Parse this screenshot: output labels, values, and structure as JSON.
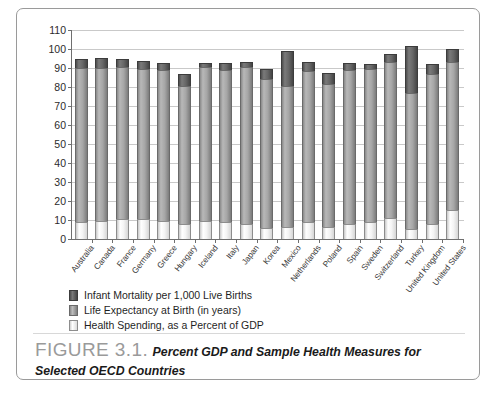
{
  "figure": {
    "label": "FIGURE 3.1.",
    "caption": "Percent GDP and Sample Health Measures for Selected OECD Countries"
  },
  "legend": {
    "position": "below-plot",
    "items": [
      {
        "label": "Infant Mortality per 1,000 Live Births",
        "color": "#5a5a5a",
        "key": "infant"
      },
      {
        "label": "Life Expectancy at Birth (in years)",
        "color": "#a6a6a6",
        "key": "life"
      },
      {
        "label": "Health Spending, as a Percent of GDP",
        "color": "#efefef",
        "key": "spend"
      }
    ]
  },
  "chart_data": {
    "type": "bar",
    "stacked": true,
    "title": "",
    "xlabel": "",
    "ylabel": "",
    "ylim": [
      0,
      110
    ],
    "yticks": [
      0,
      10,
      20,
      30,
      40,
      50,
      60,
      70,
      80,
      90,
      100,
      110
    ],
    "grid": true,
    "legend_position": "below-plot",
    "categories": [
      "Australia",
      "Canada",
      "France",
      "Germany",
      "Greece",
      "Hungary",
      "Iceland",
      "Italy",
      "Japan",
      "Korea",
      "Mexico",
      "Netherlands",
      "Poland",
      "Spain",
      "Sweden",
      "Switzerland",
      "Turkey",
      "United Kingdom",
      "United States"
    ],
    "series": [
      {
        "name": "Health Spending, as a Percent of GDP",
        "color": "#efefef",
        "values": [
          9.0,
          9.7,
          10.5,
          10.7,
          9.6,
          7.8,
          9.3,
          8.7,
          8.0,
          5.6,
          6.2,
          9.2,
          6.2,
          8.1,
          9.1,
          11.3,
          5.4,
          8.1,
          15.2
        ]
      },
      {
        "name": "Life Expectancy at Birth (in years)",
        "color": "#a6a6a6",
        "values": [
          81.0,
          80.3,
          80.3,
          79.0,
          79.3,
          72.8,
          81.2,
          80.3,
          82.3,
          78.5,
          74.6,
          79.4,
          75.2,
          80.9,
          80.6,
          81.7,
          71.6,
          79.0,
          77.8
        ]
      },
      {
        "name": "Infant Mortality per 1,000 Live Births",
        "color": "#5a5a5a",
        "values": [
          5.0,
          5.4,
          3.8,
          3.9,
          3.7,
          6.2,
          2.3,
          3.7,
          2.8,
          5.3,
          18.1,
          4.4,
          6.0,
          3.8,
          2.4,
          4.4,
          24.6,
          5.0,
          6.9
        ]
      }
    ],
    "totals": [
      95.0,
      95.4,
      94.6,
      93.6,
      92.6,
      86.8,
      92.8,
      92.7,
      93.1,
      89.4,
      98.9,
      93.0,
      87.4,
      92.8,
      92.1,
      97.4,
      101.6,
      92.1,
      99.9
    ]
  }
}
